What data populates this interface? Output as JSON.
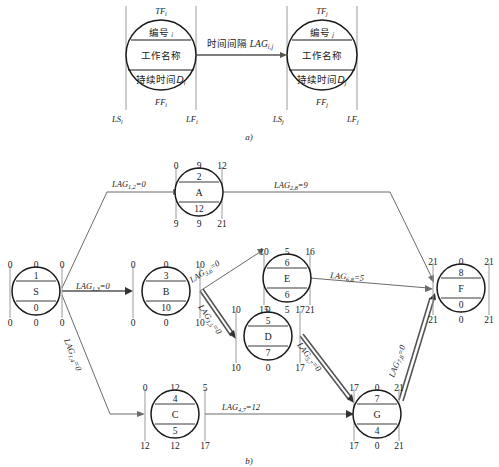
{
  "figure": {
    "panel_a_caption": "a)",
    "panel_b_caption": "b)"
  },
  "schematic": {
    "left_node": {
      "top_label": "TF",
      "top_sub": "i",
      "row1": "编号",
      "row1_sub": "i",
      "row2": "工作名称",
      "row3": "持续时间",
      "row3_sub": "D",
      "row3_sub2": "i",
      "bottom_label": "FF",
      "bottom_sub": "i",
      "left_tick": "LS",
      "left_tick_sub": "i",
      "right_tick": "LF",
      "right_tick_sub": "i"
    },
    "right_node": {
      "top_label": "TF",
      "top_sub": "j",
      "row1": "编号",
      "row1_sub": "j",
      "row2": "工作名称",
      "row3": "持续时间",
      "row3_sub": "D",
      "row3_sub2": "j",
      "bottom_label": "FF",
      "bottom_sub": "j",
      "left_tick": "LS",
      "left_tick_sub": "j",
      "right_tick": "LF",
      "right_tick_sub": "j"
    },
    "connector_label": "时间间隔",
    "connector_lag": "LAG",
    "connector_lag_sub": "i,j"
  },
  "network": {
    "nodes": [
      {
        "id": "S",
        "name": "S",
        "number": "1",
        "duration": "0",
        "top_left": "0",
        "top_mid": "0",
        "top_right": "0",
        "bot_left": "0",
        "bot_mid": "0",
        "bot_right": "0"
      },
      {
        "id": "A",
        "name": "A",
        "number": "2",
        "duration": "12",
        "top_left": "0",
        "top_mid": "9",
        "top_right": "12",
        "bot_left": "9",
        "bot_mid": "9",
        "bot_right": "21"
      },
      {
        "id": "B",
        "name": "B",
        "number": "3",
        "duration": "10",
        "top_left": "0",
        "top_mid": "0",
        "top_right": "10",
        "bot_left": "0",
        "bot_mid": "0",
        "bot_right": "10"
      },
      {
        "id": "E",
        "name": "E",
        "number": "6",
        "duration": "6",
        "top_left": "10",
        "top_mid": "5",
        "top_right": "16",
        "bot_left": "15",
        "bot_mid": "5",
        "bot_right": "21"
      },
      {
        "id": "D",
        "name": "D",
        "number": "5",
        "duration": "7",
        "top_left": "10",
        "top_mid": "0",
        "top_right": "17",
        "bot_left": "10",
        "bot_mid": "0",
        "bot_right": "17"
      },
      {
        "id": "C",
        "name": "C",
        "number": "4",
        "duration": "5",
        "top_left": "0",
        "top_mid": "12",
        "top_right": "5",
        "bot_left": "12",
        "bot_mid": "12",
        "bot_right": "17"
      },
      {
        "id": "G",
        "name": "G",
        "number": "7",
        "duration": "4",
        "top_left": "17",
        "top_mid": "0",
        "top_right": "21",
        "bot_left": "17",
        "bot_mid": "0",
        "bot_right": "21"
      },
      {
        "id": "F",
        "name": "F",
        "number": "8",
        "duration": "0",
        "top_left": "21",
        "top_mid": "0",
        "top_right": "21",
        "bot_left": "21",
        "bot_mid": "0",
        "bot_right": "21"
      }
    ],
    "edges": [
      {
        "from": "S",
        "to": "A",
        "lag_base": "LAG",
        "lag_sub": "1,2",
        "lag_value": "=0"
      },
      {
        "from": "S",
        "to": "B",
        "lag_base": "LAG",
        "lag_sub": "1,3",
        "lag_value": "=0"
      },
      {
        "from": "S",
        "to": "C",
        "lag_base": "LAG",
        "lag_sub": "1,4",
        "lag_value": "=0"
      },
      {
        "from": "A",
        "to": "F",
        "lag_base": "LAG",
        "lag_sub": "2,8",
        "lag_value": "=9"
      },
      {
        "from": "B",
        "to": "E",
        "lag_base": "LAG",
        "lag_sub": "3,6",
        "lag_value": "=0"
      },
      {
        "from": "B",
        "to": "D",
        "lag_base": "LAG",
        "lag_sub": "3,5",
        "lag_value": "=0"
      },
      {
        "from": "E",
        "to": "F",
        "lag_base": "LAG",
        "lag_sub": "6,8",
        "lag_value": "=5"
      },
      {
        "from": "D",
        "to": "G",
        "lag_base": "LAG",
        "lag_sub": "5,7",
        "lag_value": "=0"
      },
      {
        "from": "C",
        "to": "G",
        "lag_base": "LAG",
        "lag_sub": "4,7",
        "lag_value": "=12"
      },
      {
        "from": "G",
        "to": "F",
        "lag_base": "LAG",
        "lag_sub": "7,8",
        "lag_value": "=0"
      }
    ]
  }
}
